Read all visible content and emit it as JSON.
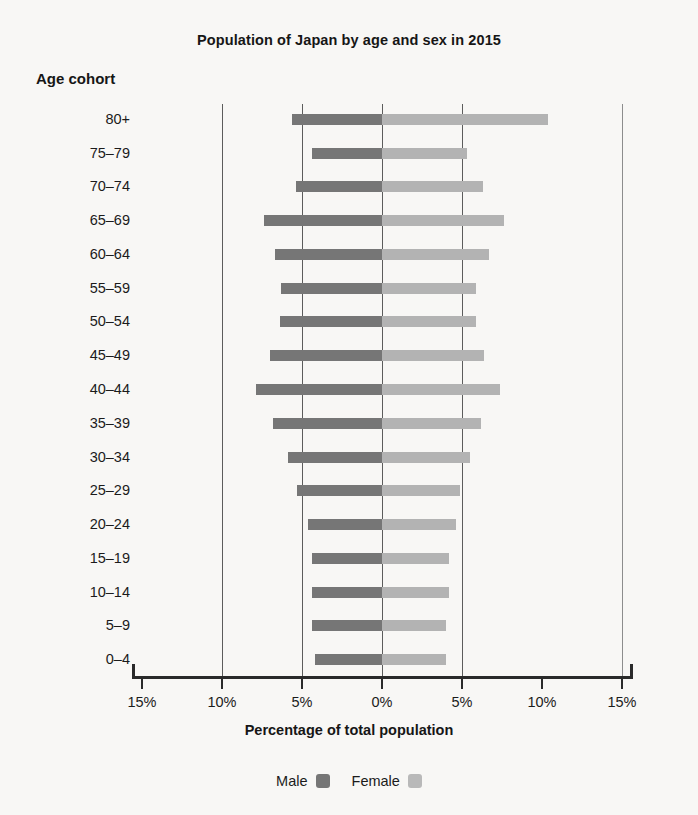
{
  "chart_data": {
    "type": "bar",
    "subtype": "population-pyramid",
    "title": "Population of Japan by age and sex in 2015",
    "xlabel": "Percentage of total population",
    "ylabel": "Age cohort",
    "xlim": [
      -15,
      15
    ],
    "xticks": [
      -15,
      -10,
      -5,
      0,
      5,
      10,
      15
    ],
    "xticklabels": [
      "15%",
      "10%",
      "5%",
      "0%",
      "5%",
      "10%",
      "15%"
    ],
    "grid": true,
    "gridlines_at": [
      -10,
      -5,
      0,
      5,
      15
    ],
    "legend_position": "bottom",
    "categories": [
      "80+",
      "75–79",
      "70–74",
      "65–69",
      "60–64",
      "55–59",
      "50–54",
      "45–49",
      "40–44",
      "35–39",
      "30–34",
      "25–29",
      "20–24",
      "15–19",
      "10–14",
      "5–9",
      "0–4"
    ],
    "series": [
      {
        "name": "Male",
        "color": "#767676",
        "direction": "left",
        "values": [
          5.6,
          4.4,
          5.4,
          7.4,
          6.7,
          6.3,
          6.4,
          7.0,
          7.9,
          6.8,
          5.9,
          5.3,
          4.6,
          4.4,
          4.4,
          4.4,
          4.2
        ]
      },
      {
        "name": "Female",
        "color": "#b3b3b3",
        "direction": "right",
        "values": [
          10.4,
          5.3,
          6.3,
          7.6,
          6.7,
          5.9,
          5.9,
          6.4,
          7.4,
          6.2,
          5.5,
          4.9,
          4.6,
          4.2,
          4.2,
          4.0,
          4.0
        ]
      }
    ]
  },
  "legend": {
    "male_label": "Male",
    "female_label": "Female"
  }
}
